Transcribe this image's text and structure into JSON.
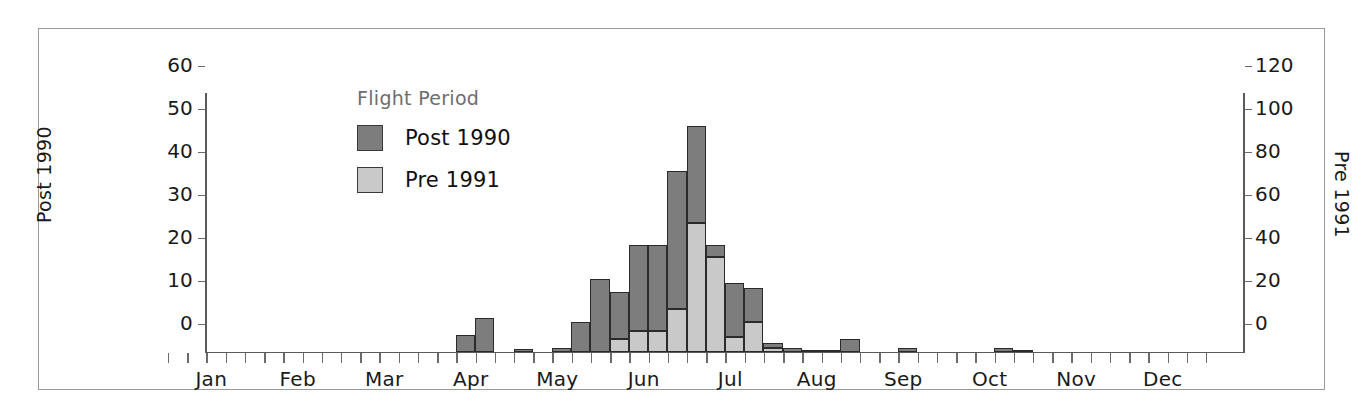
{
  "chart_data": {
    "type": "bar",
    "title": "",
    "subtitle": "",
    "stacked": true,
    "xlabel": "",
    "ylabel": "Post 1990",
    "y2label": "Pre 1991",
    "ylim": [
      0,
      60
    ],
    "y2lim": [
      0,
      120
    ],
    "yticks": [
      "0",
      "10",
      "20",
      "30",
      "40",
      "50",
      "60"
    ],
    "ytick_values": [
      0,
      10,
      20,
      30,
      40,
      50,
      60
    ],
    "y2ticks": [
      "0",
      "20",
      "40",
      "60",
      "80",
      "100",
      "120"
    ],
    "y2tick_values": [
      0,
      20,
      40,
      60,
      80,
      100,
      120
    ],
    "grid": false,
    "legend_position": "upper-left-inside",
    "legend_title": "Flight Period",
    "x_month_labels": [
      "Jan",
      "Feb",
      "Mar",
      "Apr",
      "May",
      "Jun",
      "Jul",
      "Aug",
      "Sep",
      "Oct",
      "Nov",
      "Dec"
    ],
    "x_tick_count": 55,
    "bar_interval": "weekly",
    "series": [
      {
        "name": "Post 1990",
        "color": "#7d7d7d",
        "axis": "left",
        "values": [
          0,
          0,
          0,
          0,
          0,
          0,
          0,
          0,
          0,
          0,
          0,
          0,
          0,
          4,
          8,
          0,
          0.5,
          0,
          1,
          7,
          25,
          11,
          20,
          37,
          22.5,
          3,
          8,
          12.5,
          14,
          1,
          1,
          0.3,
          0.3,
          3,
          0,
          1,
          0,
          0,
          1,
          0,
          0,
          0,
          0
        ]
      },
      {
        "name": "Pre 1991",
        "color": "#c9c9c9",
        "axis": "right",
        "values": [
          0,
          0,
          0,
          0,
          0,
          0,
          0,
          0,
          0,
          0,
          0,
          0,
          0,
          0,
          0,
          0,
          0,
          0,
          0,
          0,
          0,
          6,
          5,
          5,
          10,
          60,
          44,
          7,
          1,
          0,
          0,
          0,
          0,
          0,
          0,
          0,
          0,
          0,
          0,
          0,
          0,
          0,
          0
        ]
      }
    ],
    "bars": [
      {
        "x": 13,
        "dark": 4,
        "light": 0,
        "total": 4
      },
      {
        "x": 14,
        "dark": 8,
        "light": 0,
        "total": 8
      },
      {
        "x": 16,
        "dark": 0.6,
        "light": 0,
        "total": 0.6
      },
      {
        "x": 18,
        "dark": 1,
        "light": 0,
        "total": 1
      },
      {
        "x": 19,
        "dark": 7,
        "light": 0,
        "total": 7
      },
      {
        "x": 20,
        "dark": 17,
        "light": 0,
        "total": 17
      },
      {
        "x": 21,
        "dark": 11,
        "light": 3,
        "total": 14
      },
      {
        "x": 22,
        "dark": 20,
        "light": 5,
        "total": 25
      },
      {
        "x": 23,
        "dark": 20,
        "light": 5,
        "total": 25
      },
      {
        "x": 24,
        "dark": 32,
        "light": 10,
        "total": 42
      },
      {
        "x": 25,
        "dark": 22.5,
        "light": 30,
        "total": 52.5
      },
      {
        "x": 26,
        "dark": 3,
        "light": 22,
        "total": 25
      },
      {
        "x": 27,
        "dark": 12.5,
        "light": 3.5,
        "total": 16
      },
      {
        "x": 28,
        "dark": 8,
        "light": 7,
        "total": 15
      },
      {
        "x": 29,
        "dark": 1,
        "light": 1,
        "total": 2
      },
      {
        "x": 30,
        "dark": 1,
        "light": 0,
        "total": 1
      },
      {
        "x": 31,
        "dark": 0.4,
        "light": 0,
        "total": 0.4
      },
      {
        "x": 32,
        "dark": 0.4,
        "light": 0,
        "total": 0.4
      },
      {
        "x": 33,
        "dark": 3,
        "light": 0,
        "total": 3
      },
      {
        "x": 36,
        "dark": 1,
        "light": 0,
        "total": 1
      },
      {
        "x": 41,
        "dark": 1,
        "light": 0,
        "total": 1
      },
      {
        "x": 42,
        "dark": 0.3,
        "light": 0,
        "total": 0.3
      }
    ]
  },
  "legend": {
    "title": "Flight Period",
    "entries": [
      {
        "label": "Post 1990",
        "color": "#7d7d7d",
        "swatch": "dark"
      },
      {
        "label": "Pre 1991",
        "color": "#c9c9c9",
        "swatch": "light"
      }
    ]
  },
  "axes": {
    "left_title": "Post 1990",
    "right_title": "Pre 1991"
  }
}
